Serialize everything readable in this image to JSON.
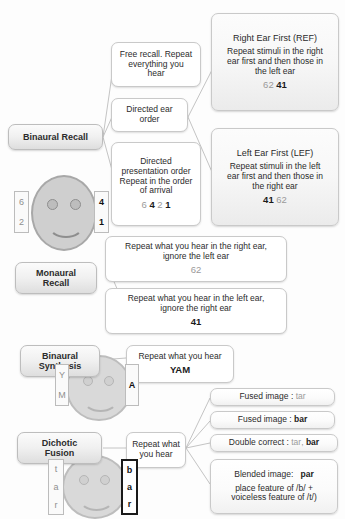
{
  "diagram": {
    "categories": {
      "binaural_recall": "Binaural Recall",
      "monaural_recall": "Monaural\nRecall",
      "monaural_recall_l1": "Monaural",
      "monaural_recall_l2": "Recall",
      "binaural_synthesis_l1": "Binaural",
      "binaural_synthesis_l2": "Synthesis",
      "dichotic_fusion_l1": "Dichotic",
      "dichotic_fusion_l2": "Fusion"
    },
    "binaural_recall": {
      "free_recall": {
        "l1": "Free recall. Repeat",
        "l2": "everything you",
        "l3": "hear"
      },
      "directed_ear_order": {
        "l1": "Directed ear",
        "l2": "order"
      },
      "directed_presentation": {
        "l1": "Directed",
        "l2": "presentation order",
        "l3": "Repeat in the order",
        "l4": "of arrival",
        "seq_1": "6",
        "seq_2": "4",
        "seq_3": "2",
        "seq_4": "1"
      },
      "ref": {
        "title": "Right Ear First (REF)",
        "l1": "Repeat stimuli in the right",
        "l2": "ear first and then those in",
        "l3": "the left ear",
        "val_gray": "62",
        "val_bold": "41"
      },
      "lef": {
        "title": "Left Ear First (LEF)",
        "l1": "Repeat stimuli in the left",
        "l2": "ear first and then those in",
        "l3": "the right ear",
        "val_bold": "41",
        "val_gray": "62"
      },
      "face_left_ear": {
        "top": "6",
        "bottom": "2"
      },
      "face_right_ear": {
        "top": "4",
        "bottom": "1"
      }
    },
    "monaural_recall": {
      "right": {
        "l1": "Repeat what you hear in the right ear,",
        "l2": "ignore the left ear",
        "value": "62"
      },
      "left": {
        "l1": "Repeat what you hear in the left ear,",
        "l2": "ignore the right ear",
        "value": "41"
      }
    },
    "binaural_synthesis": {
      "instruction": "Repeat what you hear",
      "response": "YAM",
      "left_ear": {
        "top": "Y",
        "bottom": "M"
      },
      "right_ear": {
        "letter": "A"
      }
    },
    "dichotic_fusion": {
      "instruction_l1": "Repeat what",
      "instruction_l2": "you hear",
      "left_ear": {
        "c1": "t",
        "c2": "a",
        "c3": "r"
      },
      "right_ear": {
        "c1": "b",
        "c2": "a",
        "c3": "r"
      },
      "outcomes": {
        "fused_tar_label": "Fused image :",
        "fused_tar_value": "tar",
        "fused_bar_label": "Fused image :",
        "fused_bar_value": "bar",
        "double_label": "Double correct :",
        "double_value_gray": "tar",
        "double_sep": ",",
        "double_value_bold": "bar",
        "blended_label": "Blended image:",
        "blended_value": "par",
        "blended_l2": "place feature of /b/ +",
        "blended_l3": "voiceless feature of /t/)"
      }
    },
    "colors": {
      "gray_text": "#9a9a9a",
      "bold_text": "#1b1b1b",
      "node_border": "#c9c9c9",
      "connector": "#c4c4c4",
      "face_fill": "#cfcfcf"
    }
  }
}
